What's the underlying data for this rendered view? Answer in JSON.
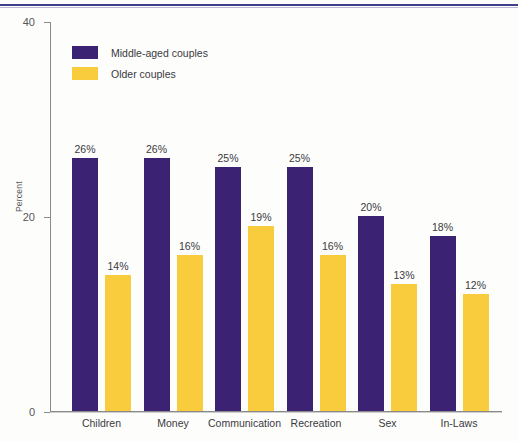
{
  "chart_data": {
    "type": "bar",
    "title": "",
    "xlabel": "",
    "ylabel": "Percent",
    "ylim": [
      0,
      40
    ],
    "yticks": [
      0,
      20,
      40
    ],
    "ytick_labels": [
      "0",
      "20",
      "40"
    ],
    "grid": false,
    "legend_position": "upper-left-inside",
    "value_suffix": "%",
    "categories": [
      "Children",
      "Money",
      "Communication",
      "Recreation",
      "Sex",
      "In-Laws"
    ],
    "series": [
      {
        "name": "Middle-aged couples",
        "color": "#3B2273",
        "values": [
          26,
          26,
          25,
          25,
          20,
          18
        ],
        "labels": [
          "26%",
          "26%",
          "25%",
          "25%",
          "20%",
          "18%"
        ]
      },
      {
        "name": "Older couples",
        "color": "#F9CC3D",
        "values": [
          14,
          16,
          19,
          16,
          13,
          12
        ],
        "labels": [
          "14%",
          "16%",
          "19%",
          "16%",
          "13%",
          "12%"
        ]
      }
    ]
  },
  "axis": {
    "y_title": "Percent",
    "tick_40": "40",
    "tick_20": "20",
    "tick_0": "0"
  },
  "legend": {
    "items": [
      {
        "label": "Middle-aged couples",
        "color": "#3B2273"
      },
      {
        "label": "Older couples",
        "color": "#F9CC3D"
      }
    ]
  },
  "colors": {
    "series_middle_aged": "#3B2273",
    "series_older": "#F9CC3D",
    "rule": "#3F3F8C",
    "axis": "#8A8A8A",
    "text": "#3A3A3C"
  }
}
